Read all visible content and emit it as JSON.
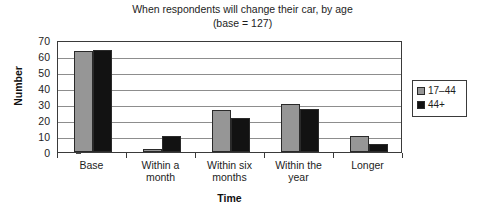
{
  "chart_data": {
    "type": "bar",
    "title": "When respondents will change their car, by age",
    "subtitle": "(base = 127)",
    "xlabel": "Time",
    "ylabel": "Number",
    "categories": [
      "Base",
      "Within a\nmonth",
      "Within six\nmonths",
      "Within the\nyear",
      "Longer"
    ],
    "category_labels": [
      {
        "line1": "Base",
        "line2": ""
      },
      {
        "line1": "Within a",
        "line2": "month"
      },
      {
        "line1": "Within six",
        "line2": "months"
      },
      {
        "line1": "Within the",
        "line2": "year"
      },
      {
        "line1": "Longer",
        "line2": ""
      }
    ],
    "series": [
      {
        "name": "17–44",
        "color": "#969696",
        "values": [
          63,
          2,
          26,
          30,
          10
        ]
      },
      {
        "name": "44+",
        "color": "#121212",
        "values": [
          64,
          10,
          21,
          27,
          5
        ]
      }
    ],
    "ylim": [
      0,
      70
    ],
    "yticks": [
      0,
      10,
      20,
      30,
      40,
      50,
      60,
      70
    ],
    "ytick_labels": [
      "0",
      "10",
      "20",
      "30",
      "40",
      "50",
      "60",
      "70"
    ],
    "grid": true,
    "grid_axis": "y",
    "legend_position": "right",
    "legend_entries": [
      "17–44",
      "44+"
    ]
  }
}
